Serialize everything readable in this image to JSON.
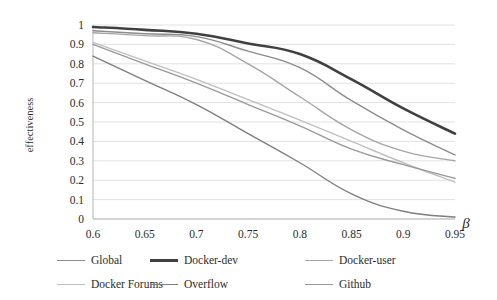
{
  "chart_data": {
    "type": "line",
    "title": "",
    "xlabel": "β",
    "ylabel": "effectiveness",
    "x": [
      0.6,
      0.65,
      0.7,
      0.75,
      0.8,
      0.85,
      0.9,
      0.95
    ],
    "xtick_labels": [
      "0.6",
      "0.65",
      "0.7",
      "0.75",
      "0.8",
      "0.85",
      "0.9",
      "0.95"
    ],
    "ytick_labels": [
      "1",
      "0.9",
      "0.8",
      "0.7",
      "0.6",
      "0.5",
      "0.4",
      "0.3",
      "0.2",
      "0.1",
      "0"
    ],
    "xlim": [
      0.6,
      0.95
    ],
    "ylim": [
      0,
      1
    ],
    "grid": "horizontal",
    "legend_position": "bottom",
    "series": [
      {
        "name": "Global",
        "color": "#8c8c8c",
        "width": 1.4,
        "values": [
          0.97,
          0.955,
          0.94,
          0.865,
          0.78,
          0.61,
          0.46,
          0.33
        ]
      },
      {
        "name": "Docker-dev",
        "color": "#404040",
        "width": 2.6,
        "values": [
          0.99,
          0.975,
          0.955,
          0.905,
          0.85,
          0.72,
          0.57,
          0.44
        ]
      },
      {
        "name": "Docker-user",
        "color": "#a6a6a6",
        "width": 1.4,
        "values": [
          0.96,
          0.945,
          0.925,
          0.8,
          0.63,
          0.46,
          0.35,
          0.3
        ]
      },
      {
        "name": "Docker Forums",
        "color": "#bfbfbf",
        "width": 1.4,
        "values": [
          0.91,
          0.815,
          0.72,
          0.615,
          0.51,
          0.4,
          0.29,
          0.19
        ]
      },
      {
        "name": "Overflow",
        "color": "#7f7f7f",
        "width": 1.4,
        "values": [
          0.84,
          0.715,
          0.59,
          0.44,
          0.29,
          0.13,
          0.04,
          0.01
        ]
      },
      {
        "name": "Github",
        "color": "#999999",
        "width": 1.4,
        "values": [
          0.9,
          0.8,
          0.7,
          0.59,
          0.48,
          0.36,
          0.28,
          0.21
        ]
      }
    ]
  },
  "legend": {
    "rows": [
      [
        "Global",
        "Docker-dev",
        "Docker-user"
      ],
      [
        "Docker Forums",
        "Overflow",
        "Github"
      ]
    ]
  }
}
